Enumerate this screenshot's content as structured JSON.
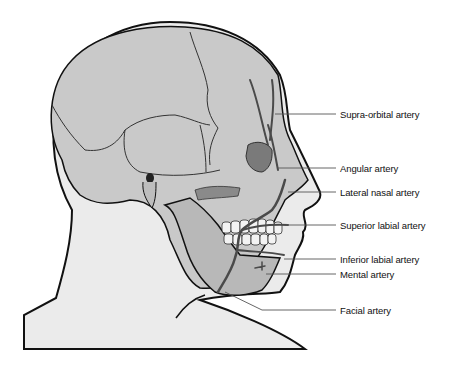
{
  "diagram": {
    "colors": {
      "skin": "#e8e8e8",
      "skull": "#c8c8c8",
      "skull_dark": "#a8a8a8",
      "orbit": "#707070",
      "artery": "#4a4a4a",
      "outline": "#111111",
      "leader": "#555555",
      "teeth": "#f2f2f2"
    },
    "labels": [
      {
        "id": "supra-orbital",
        "text": "Supra-orbital artery",
        "y": 114
      },
      {
        "id": "angular",
        "text": "Angular artery",
        "y": 168
      },
      {
        "id": "lateral-nasal",
        "text": "Lateral nasal artery",
        "y": 192
      },
      {
        "id": "superior-labial",
        "text": "Superior labial artery",
        "y": 225
      },
      {
        "id": "inferior-labial",
        "text": "Inferior labial artery",
        "y": 259
      },
      {
        "id": "mental",
        "text": "Mental artery",
        "y": 274
      },
      {
        "id": "facial",
        "text": "Facial artery",
        "y": 310
      }
    ]
  }
}
